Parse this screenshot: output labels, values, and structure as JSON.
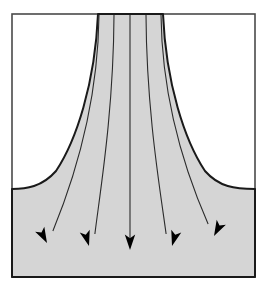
{
  "figure": {
    "description": "A funnel-shaped shaded region narrow at the top and flaring outward to fill the lower portion of a rectangular frame, with five streamline arrows fanning downward and outward.",
    "type": "flow-field-diagram",
    "canvas": {
      "width": 267,
      "height": 292
    },
    "background_color": "#ffffff"
  },
  "frame": {
    "name": "outer-border",
    "x": 12,
    "y": 14,
    "width": 243,
    "height": 263,
    "stroke_color": "#4a4a4a",
    "stroke_width": 1.6,
    "fill_color": "#ffffff"
  },
  "shaded_region": {
    "name": "flared-channel",
    "fill_color": "#d5d5d5",
    "stroke_color": "#1a1a1a",
    "stroke_width": 2.0,
    "throat_left_x": 98,
    "throat_right_x": 163,
    "throat_y": 14,
    "flare_meets_left_edge_y": 189,
    "flare_meets_right_edge_y": 189,
    "bottom_y": 277
  },
  "streamlines": {
    "count": 5,
    "stroke_color": "#2b2b2b",
    "stroke_width": 1.1,
    "arrowhead_color": "#000000",
    "lines": [
      {
        "name": "streamline-1",
        "label": "outer-left",
        "start_x": 99,
        "start_y": 15,
        "end_x": 47,
        "end_y": 243,
        "curvature": "strong-outward-left",
        "arrow_angle_deg": 208
      },
      {
        "name": "streamline-2",
        "label": "inner-left",
        "start_x": 114,
        "start_y": 15,
        "end_x": 89,
        "end_y": 246,
        "curvature": "moderate-outward-left",
        "arrow_angle_deg": 196
      },
      {
        "name": "streamline-3",
        "label": "center",
        "start_x": 130,
        "start_y": 15,
        "end_x": 130,
        "end_y": 250,
        "curvature": "straight",
        "arrow_angle_deg": 180
      },
      {
        "name": "streamline-4",
        "label": "inner-right",
        "start_x": 146,
        "start_y": 15,
        "end_x": 172,
        "end_y": 246,
        "curvature": "moderate-outward-right",
        "arrow_angle_deg": 164
      },
      {
        "name": "streamline-5",
        "label": "outer-right",
        "start_x": 161,
        "start_y": 15,
        "end_x": 214,
        "end_y": 236,
        "curvature": "strong-outward-right",
        "arrow_angle_deg": 152
      }
    ]
  }
}
